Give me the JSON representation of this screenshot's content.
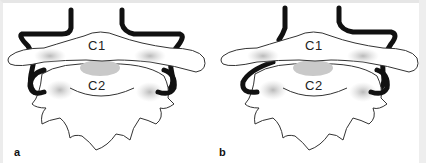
{
  "figure": {
    "panels": [
      {
        "id": "a",
        "label": "a",
        "upper_vertebra": "C1",
        "lower_vertebra": "C2",
        "artery_variant": "bilateral-looped"
      },
      {
        "id": "b",
        "label": "b",
        "upper_vertebra": "C1",
        "lower_vertebra": "C2",
        "artery_variant": "right-looped-left-straight"
      }
    ]
  },
  "colors": {
    "bone_fill": "#ffffff",
    "bone_outline": "#333333",
    "shading": "#bdbdbd",
    "artery": "#111111",
    "frame": "#e6e6e6"
  }
}
